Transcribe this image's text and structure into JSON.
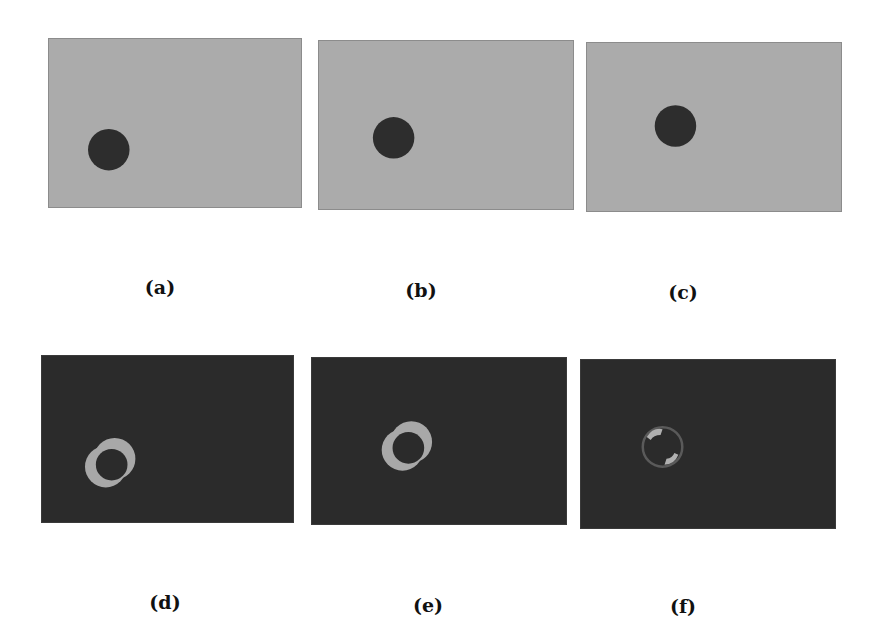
{
  "figure": {
    "colors": {
      "light_background": "#ababab",
      "light_border": "#8c8c8c",
      "dark_background": "#2b2b2b",
      "dot": "#2d2d2d",
      "ring": "#a8a8a8"
    },
    "panels": [
      {
        "id": "a",
        "label": "(a)",
        "type": "frame",
        "x": 48,
        "y": 38,
        "w": 254,
        "h": 170,
        "dot": {
          "cx": 60,
          "cy": 112,
          "r": 21
        }
      },
      {
        "id": "b",
        "label": "(b)",
        "type": "frame",
        "x": 318,
        "y": 40,
        "w": 256,
        "h": 170,
        "dot": {
          "cx": 75,
          "cy": 98,
          "r": 21
        }
      },
      {
        "id": "c",
        "label": "(c)",
        "type": "frame",
        "x": 586,
        "y": 42,
        "w": 256,
        "h": 170,
        "dot": {
          "cx": 89,
          "cy": 84,
          "r": 21
        }
      },
      {
        "id": "d",
        "label": "(d)",
        "type": "difference",
        "x": 41,
        "y": 355,
        "w": 253,
        "h": 168
      },
      {
        "id": "e",
        "label": "(e)",
        "type": "difference",
        "x": 311,
        "y": 357,
        "w": 256,
        "h": 168
      },
      {
        "id": "f",
        "label": "(f)",
        "type": "difference",
        "x": 580,
        "y": 359,
        "w": 256,
        "h": 170
      }
    ],
    "labels": [
      {
        "text": "(a)",
        "x": 160,
        "y": 276
      },
      {
        "text": "(b)",
        "x": 421,
        "y": 279
      },
      {
        "text": "(c)",
        "x": 683,
        "y": 281
      },
      {
        "text": "(d)",
        "x": 165,
        "y": 591
      },
      {
        "text": "(e)",
        "x": 428,
        "y": 594
      },
      {
        "text": "(f)",
        "x": 683,
        "y": 595
      }
    ]
  }
}
